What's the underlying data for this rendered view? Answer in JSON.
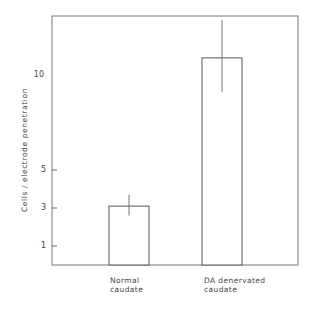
{
  "chart_data": {
    "type": "bar",
    "title": "",
    "xlabel": "",
    "ylabel": "Cells / electrode penetration",
    "categories": [
      "Normal caudate",
      "DA denervated caudate"
    ],
    "category_lines": [
      [
        "Normal",
        "caudate"
      ],
      [
        "DA denervated",
        "caudate"
      ]
    ],
    "values": [
      3.1,
      10.9
    ],
    "error_bars": [
      {
        "low": 2.6,
        "high": 3.7
      },
      {
        "low": 9.1,
        "high": 12.9
      }
    ],
    "ylim": [
      0,
      13.1
    ],
    "yticks": [
      1,
      3,
      5,
      10
    ],
    "ytick_labels": [
      "1",
      "3",
      "5",
      "10"
    ],
    "grid": false,
    "legend": null,
    "colors": {
      "bar_fill": "#ffffff",
      "bar_edge": "#555555",
      "axis": "#666666"
    }
  }
}
